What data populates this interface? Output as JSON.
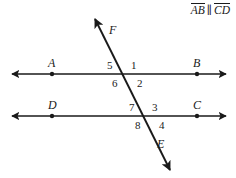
{
  "figure": {
    "type": "geometry-diagram",
    "width": 236,
    "height": 178,
    "background_color": "#ffffff",
    "stroke_color": "#1a1a1a"
  },
  "statement": {
    "first_segment": "AB",
    "parallel_symbol": "∥",
    "second_segment": "CD",
    "full_text": "AB ∥ CD"
  },
  "lines": [
    {
      "name": "line-ab",
      "kind": "parallel-line",
      "left_label": "A",
      "right_label": "B",
      "y": 74,
      "x_start": 10,
      "x_end": 228
    },
    {
      "name": "line-dc",
      "kind": "parallel-line",
      "left_label": "D",
      "right_label": "C",
      "y": 116,
      "x_start": 10,
      "x_end": 228
    },
    {
      "name": "line-fe",
      "kind": "transversal",
      "top_label": "F",
      "bottom_label": "E",
      "x_top": 93,
      "y_top": 17,
      "x_bottom": 172,
      "y_bottom": 172
    }
  ],
  "points": [
    {
      "label": "A",
      "x": 52,
      "y": 74,
      "label_x": 48,
      "label_y": 59
    },
    {
      "label": "B",
      "x": 197,
      "y": 74,
      "label_x": 193,
      "label_y": 59
    },
    {
      "label": "D",
      "x": 52,
      "y": 116,
      "label_x": 48,
      "label_y": 101
    },
    {
      "label": "C",
      "x": 197,
      "y": 116,
      "label_x": 193,
      "label_y": 101
    },
    {
      "label": "F",
      "x": 97,
      "y": 22,
      "label_x": 109,
      "label_y": 26
    },
    {
      "label": "E",
      "x": 168,
      "y": 167,
      "label_x": 156,
      "label_y": 140
    }
  ],
  "intersections": [
    {
      "name": "upper-intersection",
      "x": 126,
      "y": 74
    },
    {
      "name": "lower-intersection",
      "x": 148,
      "y": 116
    }
  ],
  "angles": [
    {
      "number": "1",
      "position": "upper-right",
      "intersection": "upper-intersection",
      "x": 131,
      "y": 62
    },
    {
      "number": "2",
      "position": "lower-right",
      "intersection": "upper-intersection",
      "x": 136,
      "y": 79
    },
    {
      "number": "3",
      "position": "upper-right",
      "intersection": "lower-intersection",
      "x": 152,
      "y": 104
    },
    {
      "number": "4",
      "position": "lower-right",
      "intersection": "lower-intersection",
      "x": 159,
      "y": 121
    },
    {
      "number": "5",
      "position": "upper-left",
      "intersection": "upper-intersection",
      "x": 108,
      "y": 62
    },
    {
      "number": "6",
      "position": "lower-left",
      "intersection": "upper-intersection",
      "x": 113,
      "y": 79
    },
    {
      "number": "7",
      "position": "upper-left",
      "intersection": "lower-intersection",
      "x": 130,
      "y": 104
    },
    {
      "number": "8",
      "position": "lower-left",
      "intersection": "lower-intersection",
      "x": 136,
      "y": 121
    }
  ]
}
